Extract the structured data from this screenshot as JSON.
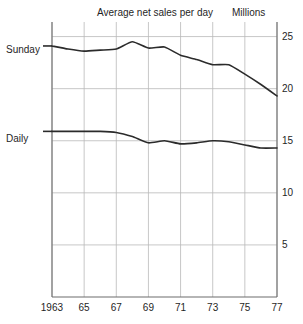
{
  "chart_data": {
    "type": "line",
    "title": "Average net sales per day",
    "unit_label": "Millions",
    "xlabel": "",
    "ylabel": "",
    "xlim": [
      1963,
      1977
    ],
    "ylim": [
      0,
      26.4
    ],
    "grid": true,
    "legend_position": "inline-left",
    "x": [
      1963,
      1964,
      1965,
      1966,
      1967,
      1968,
      1969,
      1970,
      1971,
      1972,
      1973,
      1974,
      1975,
      1976,
      1977
    ],
    "xticks": [
      1963,
      1965,
      1967,
      1969,
      1971,
      1973,
      1975,
      1977
    ],
    "xtick_labels": [
      "1963",
      "65",
      "67",
      "69",
      "71",
      "73",
      "75",
      "77"
    ],
    "yticks": [
      5,
      10,
      15,
      20,
      25
    ],
    "ytick_labels": [
      "5",
      "10",
      "15",
      "20",
      "25"
    ],
    "series": [
      {
        "name": "Sunday",
        "label": "Sunday",
        "color": "#2b2b2b",
        "values": [
          24.1,
          23.8,
          23.6,
          23.7,
          23.8,
          24.5,
          23.9,
          24.0,
          23.2,
          22.8,
          22.3,
          22.3,
          21.4,
          20.4,
          19.3
        ]
      },
      {
        "name": "Daily",
        "label": "Daily",
        "color": "#2b2b2b",
        "values": [
          15.9,
          15.9,
          15.9,
          15.9,
          15.8,
          15.4,
          14.8,
          15.0,
          14.7,
          14.8,
          15.0,
          14.9,
          14.6,
          14.3,
          14.3
        ]
      }
    ]
  },
  "style": {
    "axis_color": "#6d6d6d",
    "grid_color": "#b9b9b9",
    "line_color": "#2b2b2b",
    "text_color": "#1f1f1f",
    "background": "#ffffff"
  },
  "geometry": {
    "plot_left": 52,
    "plot_right": 277,
    "plot_top": 22,
    "plot_bottom": 297
  }
}
